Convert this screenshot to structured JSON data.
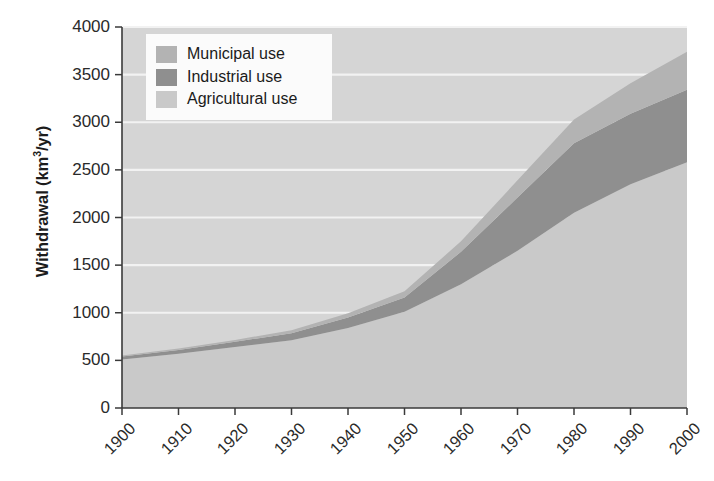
{
  "chart_data": {
    "type": "area",
    "title": "",
    "xlabel": "",
    "ylabel": "Withdrawal (km3/yr)",
    "ylabel_parts": {
      "main": "Withdrawal (km",
      "sup": "3",
      "tail": "/yr)"
    },
    "x": [
      1900,
      1910,
      1920,
      1930,
      1940,
      1950,
      1960,
      1970,
      1980,
      1990,
      2000
    ],
    "xlim": [
      1900,
      2000
    ],
    "ylim": [
      0,
      4000
    ],
    "yticks": [
      0,
      500,
      1000,
      1500,
      2000,
      2500,
      3000,
      3500,
      4000
    ],
    "ytick_labels": [
      "0",
      "500",
      "1000",
      "1500",
      "2000",
      "2500",
      "3000",
      "3500",
      "4000"
    ],
    "xtick_labels": [
      "1900",
      "1910",
      "1920",
      "1930",
      "1940",
      "1950",
      "1960",
      "1970",
      "1980",
      "1990",
      "2000"
    ],
    "grid": true,
    "grid_color": "#f2f2f2",
    "plot_bg": "#d5d5d5",
    "legend_position": "top-left",
    "stacked": true,
    "stack_order": [
      "Agricultural use",
      "Industrial use",
      "Municipal use"
    ],
    "series": [
      {
        "name": "Agricultural use",
        "color": "#c9c9c9",
        "values": [
          510,
          570,
          640,
          710,
          840,
          1010,
          1300,
          1650,
          2050,
          2350,
          2580
        ]
      },
      {
        "name": "Industrial use",
        "color": "#8f8f8f",
        "values": [
          30,
          40,
          55,
          75,
          110,
          150,
          340,
          560,
          730,
          740,
          760
        ]
      },
      {
        "name": "Municipal use",
        "color": "#b3b3b3",
        "values": [
          10,
          15,
          20,
          30,
          45,
          65,
          110,
          180,
          250,
          320,
          400
        ]
      }
    ],
    "cumulative_totals": [
      550,
      625,
      715,
      815,
      995,
      1225,
      1750,
      2390,
      3030,
      3410,
      3740
    ]
  },
  "legend": {
    "entries": [
      {
        "label": "Municipal use",
        "color": "#b3b3b3",
        "swatch": "legend-swatch-municipal"
      },
      {
        "label": "Industrial use",
        "color": "#8f8f8f",
        "swatch": "legend-swatch-industrial"
      },
      {
        "label": "Agricultural use",
        "color": "#c9c9c9",
        "swatch": "legend-swatch-agricultural"
      }
    ],
    "entry_0_label": "Municipal use",
    "entry_1_label": "Industrial use",
    "entry_2_label": "Agricultural use"
  },
  "axis": {
    "y_title_main": "Withdrawal (km",
    "y_title_sup": "3",
    "y_title_tail": "/yr)",
    "y_labels": {
      "t0": "0",
      "t500": "500",
      "t1000": "1000",
      "t1500": "1500",
      "t2000": "2000",
      "t2500": "2500",
      "t3000": "3000",
      "t3500": "3500",
      "t4000": "4000"
    },
    "x_labels": {
      "d1900": "1900",
      "d1910": "1910",
      "d1920": "1920",
      "d1930": "1930",
      "d1940": "1940",
      "d1950": "1950",
      "d1960": "1960",
      "d1970": "1970",
      "d1980": "1980",
      "d1990": "1990",
      "d2000": "2000"
    }
  },
  "colors": {
    "municipal": "#b3b3b3",
    "industrial": "#8f8f8f",
    "agricultural": "#c9c9c9",
    "plot_background": "#d5d5d5",
    "gridline": "#f2f2f2",
    "axis_line": "#3a3a3a",
    "text": "#2a2a2a",
    "legend_background": "#fbfbfb"
  }
}
